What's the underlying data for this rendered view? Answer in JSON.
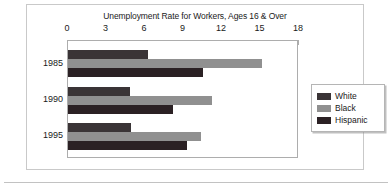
{
  "chart_data": {
    "type": "bar",
    "orientation": "horizontal",
    "title": "Unemployment Rate for Workers, Ages 16 & Over",
    "xlabel": "",
    "ylabel": "",
    "categories": [
      "1985",
      "1990",
      "1995"
    ],
    "series": [
      {
        "name": "White",
        "color": "#3a3436",
        "values": [
          6.2,
          4.8,
          4.9
        ]
      },
      {
        "name": "Black",
        "color": "#909090",
        "values": [
          15.1,
          11.2,
          10.4
        ]
      },
      {
        "name": "Hispanic",
        "color": "#2b2124",
        "values": [
          10.5,
          8.2,
          9.3
        ]
      }
    ],
    "xlim": [
      0,
      18
    ],
    "xticks": [
      "0",
      "3",
      "6",
      "9",
      "12",
      "15",
      "18"
    ],
    "xtick_values": [
      0,
      3,
      6,
      9,
      12,
      15,
      18
    ],
    "grid": false,
    "legend_position": "right"
  },
  "legend": {
    "items": [
      {
        "label": "White"
      },
      {
        "label": "Black"
      },
      {
        "label": "Hispanic"
      }
    ]
  }
}
